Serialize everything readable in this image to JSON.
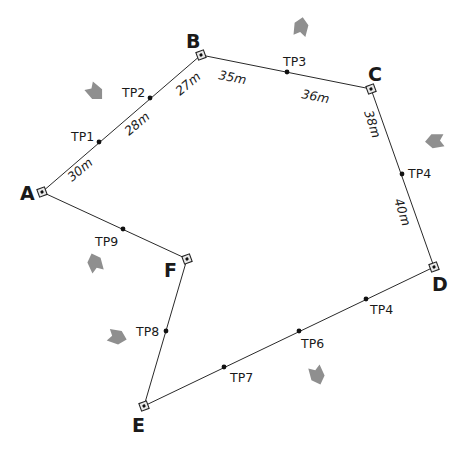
{
  "diagram": {
    "type": "closed-traverse",
    "colors": {
      "line": "#2a2a2a",
      "text": "#1a1a1a",
      "arrow": "#8f8f8f",
      "background": "#ffffff"
    },
    "stations": [
      {
        "id": "A",
        "label": "A",
        "x": 42,
        "y": 192,
        "lx": 20,
        "ly": 200
      },
      {
        "id": "B",
        "label": "B",
        "x": 201,
        "y": 55,
        "lx": 186,
        "ly": 48
      },
      {
        "id": "C",
        "label": "C",
        "x": 371,
        "y": 89,
        "lx": 368,
        "ly": 81
      },
      {
        "id": "D",
        "label": "D",
        "x": 434,
        "y": 267,
        "lx": 432,
        "ly": 291
      },
      {
        "id": "E",
        "label": "E",
        "x": 144,
        "y": 406,
        "lx": 132,
        "ly": 432
      },
      {
        "id": "F",
        "label": "F",
        "x": 187,
        "y": 259,
        "lx": 164,
        "ly": 277
      }
    ],
    "turning_points": [
      {
        "id": "TP1",
        "label": "TP1",
        "x": 99,
        "y": 142,
        "lx": 71,
        "ly": 141
      },
      {
        "id": "TP2",
        "label": "TP2",
        "x": 150,
        "y": 98,
        "lx": 122,
        "ly": 97
      },
      {
        "id": "TP3",
        "label": "TP3",
        "x": 287,
        "y": 72,
        "lx": 283,
        "ly": 66
      },
      {
        "id": "TP4-CD",
        "label": "TP4",
        "x": 402,
        "y": 174,
        "lx": 408,
        "ly": 178
      },
      {
        "id": "TP4-DE",
        "label": "TP4",
        "x": 366,
        "y": 299,
        "lx": 370,
        "ly": 314
      },
      {
        "id": "TP6",
        "label": "TP6",
        "x": 299,
        "y": 331,
        "lx": 301,
        "ly": 348
      },
      {
        "id": "TP7",
        "label": "TP7",
        "x": 224,
        "y": 367,
        "lx": 230,
        "ly": 382
      },
      {
        "id": "TP8",
        "label": "TP8",
        "x": 166,
        "y": 331,
        "lx": 136,
        "ly": 336
      },
      {
        "id": "TP9",
        "label": "TP9",
        "x": 123,
        "y": 229,
        "lx": 95,
        "ly": 246
      }
    ],
    "distances": [
      {
        "id": "A-TP1",
        "label": "30m",
        "x": 72,
        "y": 182,
        "rotate": -40
      },
      {
        "id": "TP1-TP2",
        "label": "28m",
        "x": 129,
        "y": 136,
        "rotate": -40
      },
      {
        "id": "TP2-B",
        "label": "27m",
        "x": 180,
        "y": 96,
        "rotate": -40
      },
      {
        "id": "B-TP3",
        "label": "35m",
        "x": 218,
        "y": 79,
        "rotate": 11
      },
      {
        "id": "TP3-C",
        "label": "36m",
        "x": 301,
        "y": 98,
        "rotate": 11
      },
      {
        "id": "C-TP4",
        "label": "38m",
        "x": 364,
        "y": 112,
        "rotate": 72
      },
      {
        "id": "TP4-D",
        "label": "40m",
        "x": 394,
        "y": 200,
        "rotate": 72
      }
    ],
    "arrows": [
      {
        "id": "arrow-1",
        "x": 95,
        "y": 92,
        "rotate": 45
      },
      {
        "id": "arrow-2",
        "x": 301,
        "y": 27,
        "rotate": -80
      },
      {
        "id": "arrow-3",
        "x": 435,
        "y": 141,
        "rotate": 175
      },
      {
        "id": "arrow-4",
        "x": 95,
        "y": 263,
        "rotate": -110
      },
      {
        "id": "arrow-5",
        "x": 117,
        "y": 337,
        "rotate": 15
      },
      {
        "id": "arrow-6",
        "x": 317,
        "y": 375,
        "rotate": 70
      }
    ]
  }
}
